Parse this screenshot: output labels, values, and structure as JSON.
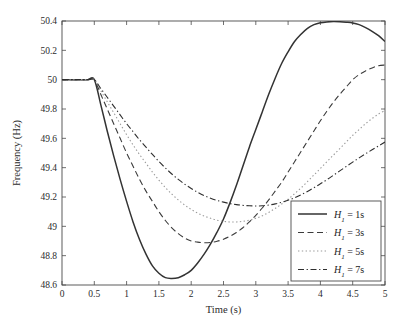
{
  "chart_data": {
    "type": "line",
    "title": "",
    "xlabel": "Time (s)",
    "ylabel": "Frequency (Hz)",
    "xlim": [
      0,
      5
    ],
    "ylim": [
      48.6,
      50.4
    ],
    "xticks": [
      "0",
      "0.5",
      "1",
      "1.5",
      "2",
      "2.5",
      "3",
      "3.5",
      "4",
      "4.5",
      "5"
    ],
    "xtick_values": [
      0,
      0.5,
      1,
      1.5,
      2,
      2.5,
      3,
      3.5,
      4,
      4.5,
      5
    ],
    "yticks": [
      "48.6",
      "48.8",
      "49",
      "49.2",
      "49.4",
      "49.6",
      "49.8",
      "50",
      "50.2",
      "50.4"
    ],
    "ytick_values": [
      48.6,
      48.8,
      49,
      49.2,
      49.4,
      49.6,
      49.8,
      50,
      50.2,
      50.4
    ],
    "grid": false,
    "legend_position": "lower-right",
    "axis_style": "box-inward-ticks",
    "series": [
      {
        "name": "H_1 = 1s",
        "label_prefix": "H",
        "label_sub": "1",
        "label_suffix": " = 1s",
        "dash": "solid",
        "color": "#333333",
        "width": 1.5,
        "x": [
          0,
          0.1,
          0.2,
          0.3,
          0.4,
          0.5,
          0.6,
          0.7,
          0.8,
          0.9,
          1.0,
          1.1,
          1.2,
          1.3,
          1.4,
          1.5,
          1.6,
          1.7,
          1.8,
          1.9,
          2.0,
          2.1,
          2.2,
          2.3,
          2.4,
          2.5,
          2.6,
          2.7,
          2.8,
          2.9,
          3.0,
          3.1,
          3.2,
          3.3,
          3.4,
          3.5,
          3.6,
          3.7,
          3.8,
          3.9,
          4.0,
          4.1,
          4.2,
          4.3,
          4.4,
          4.5,
          4.6,
          4.7,
          4.8,
          4.9,
          5.0
        ],
        "y": [
          50,
          50,
          50,
          50,
          50,
          50,
          49.83,
          49.65,
          49.48,
          49.32,
          49.17,
          49.03,
          48.91,
          48.81,
          48.73,
          48.68,
          48.65,
          48.645,
          48.65,
          48.67,
          48.7,
          48.75,
          48.81,
          48.88,
          48.96,
          49.05,
          49.16,
          49.28,
          49.41,
          49.54,
          49.66,
          49.78,
          49.9,
          50.01,
          50.11,
          50.19,
          50.26,
          50.31,
          50.35,
          50.375,
          50.388,
          50.394,
          50.396,
          50.395,
          50.392,
          50.387,
          50.375,
          50.355,
          50.33,
          50.3,
          50.26
        ]
      },
      {
        "name": "H_1 = 3s",
        "label_prefix": "H",
        "label_sub": "1",
        "label_suffix": " = 3s",
        "dash": "dashed",
        "color": "#3b3b3b",
        "width": 1.1,
        "x": [
          0,
          0.1,
          0.2,
          0.3,
          0.4,
          0.5,
          0.6,
          0.7,
          0.8,
          0.9,
          1.0,
          1.1,
          1.2,
          1.3,
          1.4,
          1.5,
          1.6,
          1.7,
          1.8,
          1.9,
          2.0,
          2.1,
          2.2,
          2.3,
          2.4,
          2.5,
          2.6,
          2.7,
          2.8,
          2.9,
          3.0,
          3.1,
          3.2,
          3.3,
          3.4,
          3.5,
          3.6,
          3.7,
          3.8,
          3.9,
          4.0,
          4.1,
          4.2,
          4.3,
          4.4,
          4.5,
          4.6,
          4.7,
          4.8,
          4.9,
          5.0
        ],
        "y": [
          50,
          50,
          50,
          50,
          50,
          50,
          49.9,
          49.8,
          49.7,
          49.6,
          49.5,
          49.41,
          49.32,
          49.24,
          49.17,
          49.1,
          49.04,
          48.99,
          48.95,
          48.92,
          48.9,
          48.892,
          48.888,
          48.89,
          48.898,
          48.912,
          48.932,
          48.958,
          48.99,
          49.03,
          49.075,
          49.125,
          49.18,
          49.24,
          49.3,
          49.37,
          49.44,
          49.51,
          49.58,
          49.65,
          49.72,
          49.785,
          49.845,
          49.9,
          49.95,
          50.0,
          50.035,
          50.06,
          50.08,
          50.095,
          50.1
        ]
      },
      {
        "name": "H_1 = 5s",
        "label_prefix": "H",
        "label_sub": "1",
        "label_suffix": " = 5s",
        "dash": "dotted",
        "color": "#9a9a9a",
        "width": 1.1,
        "x": [
          0,
          0.1,
          0.2,
          0.3,
          0.4,
          0.5,
          0.6,
          0.7,
          0.8,
          0.9,
          1.0,
          1.1,
          1.2,
          1.3,
          1.4,
          1.5,
          1.6,
          1.7,
          1.8,
          1.9,
          2.0,
          2.1,
          2.2,
          2.3,
          2.4,
          2.5,
          2.6,
          2.7,
          2.8,
          2.9,
          3.0,
          3.1,
          3.2,
          3.3,
          3.4,
          3.5,
          3.6,
          3.7,
          3.8,
          3.9,
          4.0,
          4.1,
          4.2,
          4.3,
          4.4,
          4.5,
          4.6,
          4.7,
          4.8,
          4.9,
          5.0
        ],
        "y": [
          50,
          50,
          50,
          50,
          50,
          50,
          49.925,
          49.85,
          49.775,
          49.7,
          49.625,
          49.555,
          49.49,
          49.43,
          49.37,
          49.315,
          49.265,
          49.22,
          49.18,
          49.145,
          49.115,
          49.09,
          49.07,
          49.055,
          49.042,
          49.034,
          49.03,
          49.03,
          49.034,
          49.042,
          49.055,
          49.072,
          49.095,
          49.122,
          49.152,
          49.185,
          49.222,
          49.262,
          49.305,
          49.35,
          49.395,
          49.44,
          49.485,
          49.53,
          49.575,
          49.62,
          49.66,
          49.7,
          49.735,
          49.765,
          49.79
        ]
      },
      {
        "name": "H_1 = 7s",
        "label_prefix": "H",
        "label_sub": "1",
        "label_suffix": " = 7s",
        "dash": "dashdot",
        "color": "#2e2e2e",
        "width": 1.1,
        "x": [
          0,
          0.1,
          0.2,
          0.3,
          0.4,
          0.5,
          0.6,
          0.7,
          0.8,
          0.9,
          1.0,
          1.1,
          1.2,
          1.3,
          1.4,
          1.5,
          1.6,
          1.7,
          1.8,
          1.9,
          2.0,
          2.1,
          2.2,
          2.3,
          2.4,
          2.5,
          2.6,
          2.7,
          2.8,
          2.9,
          3.0,
          3.1,
          3.2,
          3.3,
          3.4,
          3.5,
          3.6,
          3.7,
          3.8,
          3.9,
          4.0,
          4.1,
          4.2,
          4.3,
          4.4,
          4.5,
          4.6,
          4.7,
          4.8,
          4.9,
          5.0
        ],
        "y": [
          50,
          50,
          50,
          50,
          50,
          50,
          49.94,
          49.88,
          49.82,
          49.76,
          49.7,
          49.645,
          49.59,
          49.54,
          49.49,
          49.442,
          49.398,
          49.357,
          49.32,
          49.287,
          49.258,
          49.232,
          49.21,
          49.192,
          49.177,
          49.165,
          49.155,
          49.148,
          49.143,
          49.14,
          49.139,
          49.14,
          49.145,
          49.153,
          49.164,
          49.178,
          49.195,
          49.215,
          49.238,
          49.263,
          49.29,
          49.318,
          49.348,
          49.378,
          49.408,
          49.438,
          49.467,
          49.495,
          49.522,
          49.548,
          49.575
        ]
      }
    ]
  }
}
